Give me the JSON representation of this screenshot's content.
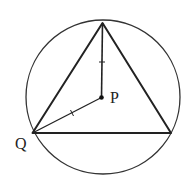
{
  "diagram": {
    "circle": {
      "cx": 103,
      "cy": 97,
      "r": 77,
      "stroke": "#333333"
    },
    "triangle": {
      "vertices": [
        [
          102.5,
          23
        ],
        [
          32.5,
          133
        ],
        [
          171,
          133
        ]
      ],
      "stroke": "#222222"
    },
    "center_point": {
      "x": 101.5,
      "y": 97.5,
      "label": "P"
    },
    "vertex_label": {
      "label": "Q"
    },
    "segments": [
      {
        "from": "P",
        "to": "top vertex",
        "tick_mark": true
      },
      {
        "from": "P",
        "to": "Q",
        "tick_mark": true
      }
    ]
  },
  "labels": {
    "p": "P",
    "q": "Q"
  }
}
